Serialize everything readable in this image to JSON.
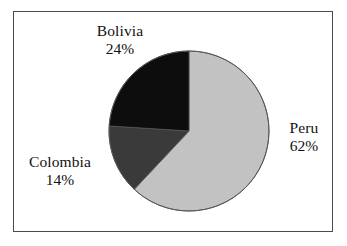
{
  "figure": {
    "background_color": "#ffffff",
    "frame_color": "#4a4a4a",
    "text_color": "#111111"
  },
  "chart_data": {
    "type": "pie",
    "title": "",
    "subtitle": "",
    "xlabel": "",
    "ylabel": "",
    "legend_position": "none",
    "grid": false,
    "labels_inside": false,
    "start_angle_deg": 0,
    "direction": "clockwise",
    "categories": [
      "Peru",
      "Colombia",
      "Bolivia"
    ],
    "values": [
      62,
      14,
      24
    ],
    "value_unit": "%",
    "colors": [
      "#c2c2c2",
      "#3a3a3a",
      "#0d0d0d"
    ],
    "slices": [
      {
        "name": "Peru",
        "value": 62,
        "value_text": "62%",
        "color": "#c2c2c2",
        "start_angle_deg": 0,
        "end_angle_deg": 223.2,
        "label_position": "right"
      },
      {
        "name": "Colombia",
        "value": 14,
        "value_text": "14%",
        "color": "#3a3a3a",
        "start_angle_deg": 223.2,
        "end_angle_deg": 273.6,
        "label_position": "bottom-left"
      },
      {
        "name": "Bolivia",
        "value": 24,
        "value_text": "24%",
        "color": "#0d0d0d",
        "start_angle_deg": 273.6,
        "end_angle_deg": 360,
        "label_position": "top-left"
      }
    ],
    "annotations": [
      {
        "text": "Bolivia",
        "value_text": "24%"
      },
      {
        "text": "Peru",
        "value_text": "62%"
      },
      {
        "text": "Colombia",
        "value_text": "14%"
      }
    ]
  },
  "labels": {
    "bolivia": {
      "name": "Bolivia",
      "value": "24%"
    },
    "peru": {
      "name": "Peru",
      "value": "62%"
    },
    "colombia": {
      "name": "Colombia",
      "value": "14%"
    }
  }
}
